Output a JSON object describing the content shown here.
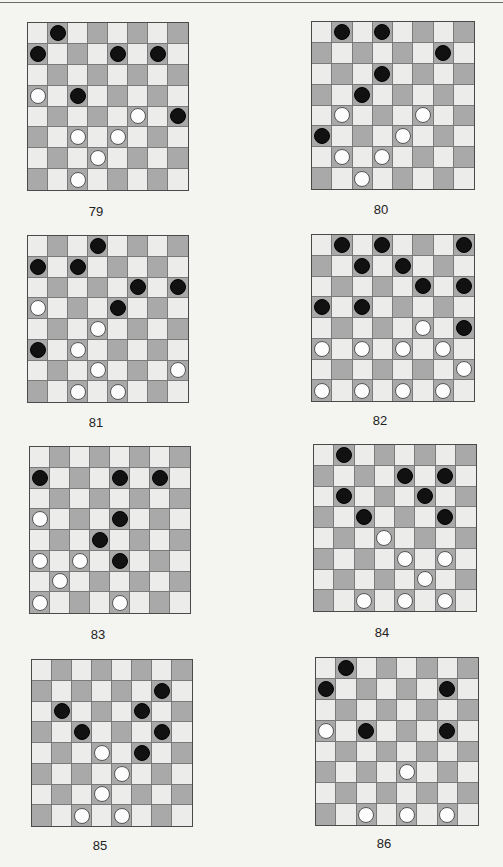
{
  "colors": {
    "background": "#f4f4f1",
    "light_square": "#ececea",
    "dark_square": "#a9a9a9",
    "black_piece": "#111111",
    "white_piece": "#fdfdfd"
  },
  "diagrams": [
    {
      "label": "79",
      "box": {
        "x": 27,
        "y": 22,
        "w": 162,
        "h": 169
      },
      "black": [
        [
          0,
          1
        ],
        [
          1,
          0
        ],
        [
          1,
          4
        ],
        [
          1,
          6
        ],
        [
          3,
          2
        ],
        [
          4,
          7
        ]
      ],
      "white": [
        [
          3,
          0
        ],
        [
          4,
          5
        ],
        [
          5,
          2
        ],
        [
          5,
          4
        ],
        [
          6,
          3
        ],
        [
          7,
          2
        ]
      ]
    },
    {
      "label": "80",
      "box": {
        "x": 311,
        "y": 21,
        "w": 164,
        "h": 169
      },
      "black": [
        [
          0,
          1
        ],
        [
          0,
          3
        ],
        [
          1,
          6
        ],
        [
          2,
          3
        ],
        [
          3,
          2
        ],
        [
          5,
          0
        ]
      ],
      "white": [
        [
          4,
          1
        ],
        [
          4,
          5
        ],
        [
          5,
          4
        ],
        [
          6,
          1
        ],
        [
          6,
          3
        ],
        [
          7,
          2
        ]
      ]
    },
    {
      "label": "81",
      "box": {
        "x": 27,
        "y": 235,
        "w": 162,
        "h": 168
      },
      "black": [
        [
          0,
          3
        ],
        [
          1,
          0
        ],
        [
          1,
          2
        ],
        [
          2,
          5
        ],
        [
          2,
          7
        ],
        [
          3,
          4
        ],
        [
          5,
          0
        ]
      ],
      "white": [
        [
          3,
          0
        ],
        [
          4,
          3
        ],
        [
          5,
          2
        ],
        [
          6,
          3
        ],
        [
          6,
          7
        ],
        [
          7,
          2
        ],
        [
          7,
          4
        ]
      ]
    },
    {
      "label": "82",
      "box": {
        "x": 311,
        "y": 234,
        "w": 164,
        "h": 168
      },
      "black": [
        [
          0,
          1
        ],
        [
          0,
          3
        ],
        [
          0,
          7
        ],
        [
          1,
          2
        ],
        [
          1,
          4
        ],
        [
          2,
          5
        ],
        [
          2,
          7
        ],
        [
          3,
          0
        ],
        [
          3,
          2
        ],
        [
          4,
          7
        ]
      ],
      "white": [
        [
          4,
          5
        ],
        [
          5,
          0
        ],
        [
          5,
          2
        ],
        [
          5,
          4
        ],
        [
          5,
          6
        ],
        [
          6,
          7
        ],
        [
          7,
          0
        ],
        [
          7,
          2
        ],
        [
          7,
          4
        ],
        [
          7,
          6
        ]
      ]
    },
    {
      "label": "83",
      "box": {
        "x": 29,
        "y": 446,
        "w": 162,
        "h": 168
      },
      "black": [
        [
          1,
          0
        ],
        [
          1,
          4
        ],
        [
          1,
          6
        ],
        [
          3,
          4
        ],
        [
          4,
          3
        ],
        [
          5,
          4
        ]
      ],
      "white": [
        [
          3,
          0
        ],
        [
          5,
          0
        ],
        [
          5,
          2
        ],
        [
          6,
          1
        ],
        [
          7,
          0
        ],
        [
          7,
          4
        ]
      ]
    },
    {
      "label": "84",
      "box": {
        "x": 313,
        "y": 444,
        "w": 164,
        "h": 168
      },
      "black": [
        [
          0,
          1
        ],
        [
          1,
          4
        ],
        [
          1,
          6
        ],
        [
          2,
          1
        ],
        [
          2,
          5
        ],
        [
          3,
          2
        ],
        [
          3,
          6
        ]
      ],
      "white": [
        [
          4,
          3
        ],
        [
          5,
          4
        ],
        [
          5,
          6
        ],
        [
          6,
          5
        ],
        [
          7,
          2
        ],
        [
          7,
          4
        ],
        [
          7,
          6
        ]
      ]
    },
    {
      "label": "85",
      "box": {
        "x": 31,
        "y": 659,
        "w": 162,
        "h": 168
      },
      "black": [
        [
          1,
          6
        ],
        [
          2,
          1
        ],
        [
          2,
          5
        ],
        [
          3,
          2
        ],
        [
          3,
          6
        ],
        [
          4,
          5
        ]
      ],
      "white": [
        [
          4,
          3
        ],
        [
          5,
          4
        ],
        [
          6,
          3
        ],
        [
          7,
          2
        ],
        [
          7,
          4
        ]
      ]
    },
    {
      "label": "86",
      "box": {
        "x": 315,
        "y": 657,
        "w": 164,
        "h": 169
      },
      "black": [
        [
          0,
          1
        ],
        [
          1,
          0
        ],
        [
          1,
          6
        ],
        [
          3,
          2
        ],
        [
          3,
          6
        ]
      ],
      "white": [
        [
          3,
          0
        ],
        [
          5,
          4
        ],
        [
          7,
          2
        ],
        [
          7,
          4
        ],
        [
          7,
          6
        ]
      ]
    }
  ],
  "labels_pos": [
    {
      "x": 78,
      "y": 204
    },
    {
      "x": 363,
      "y": 202
    },
    {
      "x": 78,
      "y": 415
    },
    {
      "x": 362,
      "y": 413
    },
    {
      "x": 80,
      "y": 627
    },
    {
      "x": 364,
      "y": 625
    },
    {
      "x": 82,
      "y": 838
    },
    {
      "x": 366,
      "y": 836
    }
  ]
}
